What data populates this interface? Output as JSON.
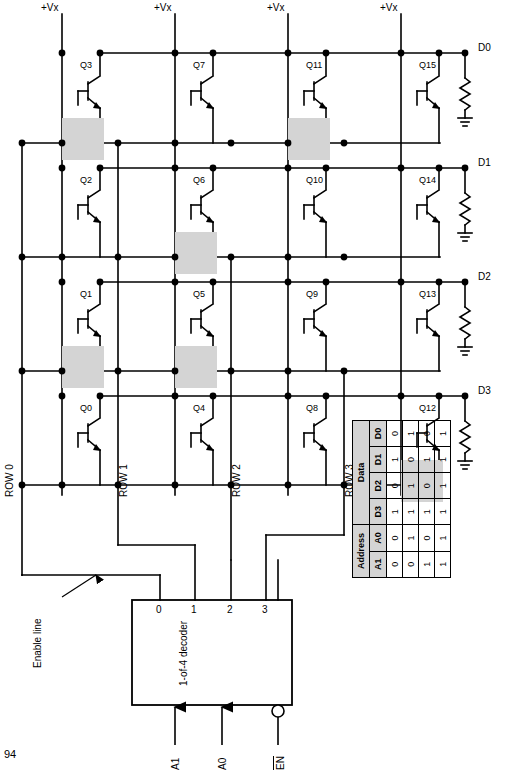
{
  "page_number": "94",
  "diagram": {
    "supply_labels": [
      "+Vx",
      "+Vx",
      "+Vx",
      "+Vx"
    ],
    "transistors": [
      "Q3",
      "Q7",
      "Q11",
      "Q15",
      "Q2",
      "Q6",
      "Q10",
      "Q14",
      "Q1",
      "Q5",
      "Q9",
      "Q13",
      "Q0",
      "Q4",
      "Q8",
      "Q12"
    ],
    "data_outputs": [
      "D0",
      "D1",
      "D2",
      "D3"
    ],
    "row_labels": [
      "ROW 0",
      "ROW 1",
      "ROW 2",
      "ROW 3"
    ],
    "decoder": {
      "name_line1": "1-of-4",
      "name_line2": "decoder",
      "output_pins": [
        "0",
        "1",
        "2",
        "3"
      ],
      "inputs": [
        "A1",
        "A0"
      ],
      "enable_pin": "EN"
    },
    "enable_annotation_line1": "Enable",
    "enable_annotation_line2": "line",
    "colors": {
      "wire": "#000000",
      "cell_fill": "#d4d4d4",
      "table_header_fill": "#d4d4d4",
      "background": "#ffffff"
    }
  },
  "truth_table": {
    "group_headers": [
      "Address",
      "Data"
    ],
    "columns": [
      "A1",
      "A0",
      "D3",
      "D2",
      "D1",
      "D0"
    ],
    "rows": [
      [
        "0",
        "0",
        "1",
        "0",
        "1",
        "0"
      ],
      [
        "0",
        "1",
        "1",
        "1",
        "0",
        "1"
      ],
      [
        "1",
        "0",
        "1",
        "0",
        "1",
        "0"
      ],
      [
        "1",
        "1",
        "1",
        "1",
        "1",
        "1"
      ]
    ]
  }
}
